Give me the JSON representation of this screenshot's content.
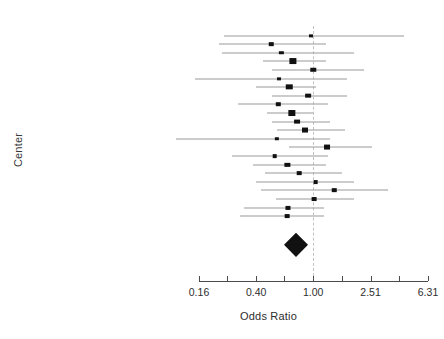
{
  "chart_data": {
    "type": "forest",
    "title": "",
    "xlabel": "Odds Ratio",
    "ylabel": "Center",
    "scale": "log",
    "null_value": 1.0,
    "xlim": [
      0.16,
      6.31
    ],
    "grid": false,
    "legend": "none",
    "axis": {
      "tick_values": [
        0.16,
        0.25,
        0.4,
        0.63,
        1.0,
        1.59,
        2.51,
        3.98,
        6.31
      ],
      "tick_labels": [
        "0.16",
        "",
        "0.40",
        "",
        "1.00",
        "",
        "2.51",
        "",
        "6.31"
      ],
      "labeled_ticks": [
        "0.16",
        "0.40",
        "1.00",
        "2.51",
        "6.31"
      ]
    },
    "categories": [
      "Center 1",
      "Center 2",
      "Center 3",
      "Center 4",
      "Center 5",
      "Center 6",
      "Center 7",
      "Center 8",
      "Center 9",
      "Center 10",
      "Center 11",
      "Center 12",
      "Center 13",
      "Center 14",
      "Center 15",
      "Center 16",
      "Center 17",
      "Center 18",
      "Center 19",
      "Center 20",
      "Center 21",
      "Center 22"
    ],
    "summary_label": "Summary",
    "studies": [
      {
        "label": "Center 1",
        "or": 0.96,
        "lo": 0.24,
        "hi": 4.27,
        "weight": 0.35
      },
      {
        "label": "Center 2",
        "or": 0.51,
        "lo": 0.22,
        "hi": 1.22,
        "weight": 0.55
      },
      {
        "label": "Center 3",
        "or": 0.6,
        "lo": 0.23,
        "hi": 1.94,
        "weight": 0.45
      },
      {
        "label": "Center 4",
        "or": 0.72,
        "lo": 0.45,
        "hi": 1.22,
        "weight": 2.6
      },
      {
        "label": "Center 5",
        "or": 1.0,
        "lo": 0.52,
        "hi": 2.25,
        "weight": 1.1
      },
      {
        "label": "Center 6",
        "or": 0.58,
        "lo": 0.15,
        "hi": 1.73,
        "weight": 0.35
      },
      {
        "label": "Center 7",
        "or": 0.68,
        "lo": 0.4,
        "hi": 1.05,
        "weight": 1.9
      },
      {
        "label": "Center 8",
        "or": 0.92,
        "lo": 0.52,
        "hi": 1.72,
        "weight": 1.3
      },
      {
        "label": "Center 9",
        "or": 0.57,
        "lo": 0.3,
        "hi": 1.26,
        "weight": 0.5
      },
      {
        "label": "Center 10",
        "or": 0.71,
        "lo": 0.48,
        "hi": 1.0,
        "weight": 2.7
      },
      {
        "label": "Center 11",
        "or": 0.77,
        "lo": 0.52,
        "hi": 1.32,
        "weight": 1.4
      },
      {
        "label": "Center 12",
        "or": 0.88,
        "lo": 0.56,
        "hi": 1.66,
        "weight": 1.5
      },
      {
        "label": "Center 13",
        "or": 0.56,
        "lo": 0.11,
        "hi": 1.3,
        "weight": 0.45
      },
      {
        "label": "Center 14",
        "or": 1.25,
        "lo": 0.68,
        "hi": 2.55,
        "weight": 1.45
      },
      {
        "label": "Center 15",
        "or": 0.54,
        "lo": 0.27,
        "hi": 1.26,
        "weight": 0.6
      },
      {
        "label": "Center 16",
        "or": 0.66,
        "lo": 0.38,
        "hi": 1.22,
        "weight": 0.95
      },
      {
        "label": "Center 17",
        "or": 0.8,
        "lo": 0.46,
        "hi": 1.6,
        "weight": 0.6
      },
      {
        "label": "Center 18",
        "or": 1.04,
        "lo": 0.4,
        "hi": 1.94,
        "weight": 0.65
      },
      {
        "label": "Center 19",
        "or": 1.4,
        "lo": 0.43,
        "hi": 3.3,
        "weight": 0.55
      },
      {
        "label": "Center 20",
        "or": 1.02,
        "lo": 0.55,
        "hi": 1.92,
        "weight": 0.7
      },
      {
        "label": "Center 21",
        "or": 0.67,
        "lo": 0.33,
        "hi": 1.18,
        "weight": 0.85
      },
      {
        "label": "Center 22",
        "or": 0.66,
        "lo": 0.31,
        "hi": 1.18,
        "weight": 0.65
      }
    ],
    "summary": {
      "label": "Summary",
      "or": 0.76,
      "lo": 0.66,
      "hi": 0.88
    }
  },
  "colors": {
    "marker": "#111111",
    "ci_line": "#9a9a9a",
    "null_line": "#c2c2c2",
    "axis": "#4a4a4a",
    "text": "#2e2e2e",
    "background": "#ffffff"
  }
}
